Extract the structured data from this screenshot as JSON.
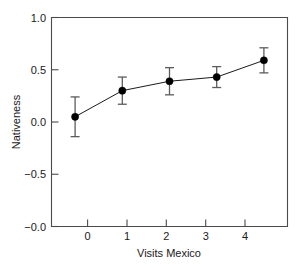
{
  "chart_data": {
    "type": "line",
    "title": "",
    "subtitle": "",
    "xlabel": "Visits Mexico",
    "ylabel": "Nativeness",
    "x": [
      0,
      1,
      2,
      3,
      4
    ],
    "xtick_labels": [
      "0",
      "1",
      "2",
      "3",
      "4"
    ],
    "xlim": [
      -0.5,
      4.5
    ],
    "ytick_values": [
      1.0,
      0.5,
      0.0,
      -0.5,
      -1.0
    ],
    "ytick_labels": [
      "1.0",
      "0.5",
      "0.0",
      "−0.5",
      "−0.0"
    ],
    "ylim": [
      -1.0,
      1.0
    ],
    "grid": false,
    "legend": null,
    "legend_position": "none",
    "series": [
      {
        "name": "Nativeness",
        "values": [
          0.05,
          0.3,
          0.39,
          0.43,
          0.59
        ],
        "error_low": [
          -0.14,
          0.17,
          0.26,
          0.33,
          0.47
        ],
        "error_high": [
          0.24,
          0.43,
          0.52,
          0.53,
          0.71
        ],
        "marker": "filled-circle",
        "line_color": "#000000",
        "marker_color": "#000000",
        "error_color": "#5c5c5c"
      }
    ],
    "colors": {
      "background": "#ffffff",
      "axis": "#4a4a4a",
      "text": "#1a1a1a",
      "line": "#000000",
      "marker": "#000000",
      "error_bar": "#5c5c5c"
    }
  }
}
